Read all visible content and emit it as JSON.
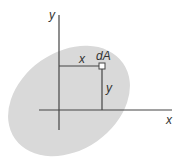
{
  "diagram": {
    "type": "area-moment-element",
    "colors": {
      "region_fill": "#d9d9d9",
      "line": "#444444",
      "text": "#333333",
      "element_fill": "#ffffff"
    },
    "labels": {
      "y_axis": "y",
      "x_axis": "x",
      "element": "dA",
      "x_distance": "x",
      "y_distance": "y"
    }
  }
}
